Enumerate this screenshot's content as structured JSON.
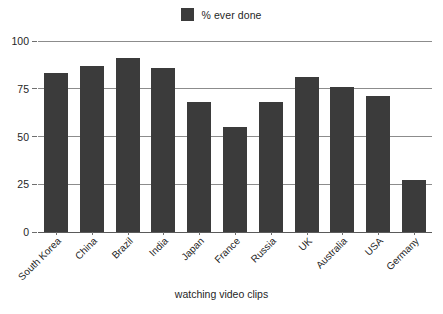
{
  "chart_data": {
    "type": "bar",
    "title": "",
    "subtitle": "",
    "xlabel": "watching video clips",
    "ylabel": "",
    "categories": [
      "South Korea",
      "China",
      "Brazil",
      "India",
      "Japan",
      "France",
      "Russia",
      "UK",
      "Australia",
      "USA",
      "Germany"
    ],
    "series": [
      {
        "name": "% ever done",
        "values": [
          83,
          87,
          91,
          86,
          68,
          55,
          68,
          81,
          76,
          71,
          27
        ],
        "color": "#3b3b3b"
      }
    ],
    "values": [
      83,
      87,
      91,
      86,
      68,
      55,
      68,
      81,
      76,
      71,
      27
    ],
    "ylim": [
      0,
      100
    ],
    "yticks": [
      0,
      25,
      50,
      75,
      100
    ],
    "ytick_labels": [
      "0",
      "25",
      "50",
      "75",
      "100"
    ],
    "grid": true,
    "grid_axis": "y",
    "legend": {
      "position": "top-center",
      "entries": [
        {
          "label": "% ever done",
          "swatch_name": "legend-swatch-pct-ever-done",
          "color": "#3b3b3b"
        }
      ]
    },
    "xtick_rotation": -45,
    "background_color": "#ffffff",
    "axis_color": "#8c8c8c"
  }
}
